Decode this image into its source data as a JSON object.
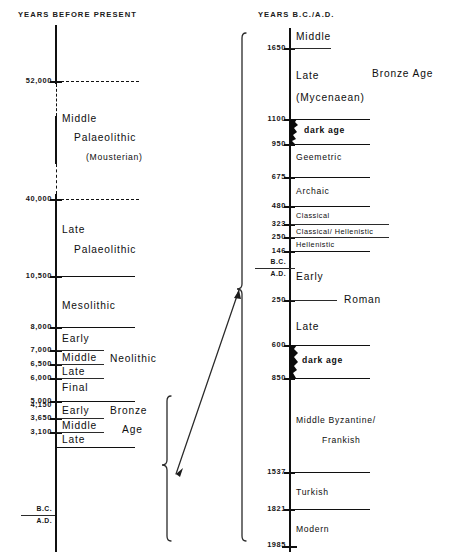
{
  "figure": {
    "type": "timeline-diagram",
    "left_column_title": "YEARS BEFORE PRESENT",
    "right_column_title": "YEARS B.C./A.D."
  },
  "left_axis": {
    "title": "YEARS BEFORE PRESENT",
    "unit": "years before present",
    "ticks": [
      {
        "label": "52,000",
        "kind": "dashed"
      },
      {
        "label": "40,000",
        "kind": "dashed"
      },
      {
        "label": "10,500",
        "kind": "solid"
      },
      {
        "label": "8,000",
        "kind": "solid"
      },
      {
        "label": "7,000",
        "kind": "solid"
      },
      {
        "label": "6,500",
        "kind": "solid"
      },
      {
        "label": "6,000",
        "kind": "solid"
      },
      {
        "label": "5,000",
        "kind": "solid"
      },
      {
        "label": "4,150",
        "kind": "solid"
      },
      {
        "label": "3,650",
        "kind": "solid"
      },
      {
        "label": "3,100",
        "kind": "solid"
      },
      {
        "label": "B.C.",
        "kind": "era"
      },
      {
        "label": "A.D.",
        "kind": "era"
      }
    ],
    "periods": [
      {
        "name": "Middle",
        "second_line": "Palaeolithic",
        "note": "(Mousterian)"
      },
      {
        "name": "Late",
        "second_line": "Palaeolithic"
      },
      {
        "name": "Mesolithic"
      },
      {
        "name": "Early"
      },
      {
        "name": "Middle"
      },
      {
        "name": "Late"
      },
      {
        "name": "Final"
      },
      {
        "name": "Early"
      },
      {
        "name": "Middle"
      },
      {
        "name": "Late"
      }
    ],
    "group_labels": [
      {
        "name": "Neolithic"
      },
      {
        "name": "Bronze",
        "second_line": "Age"
      }
    ]
  },
  "right_axis": {
    "title": "YEARS B.C./A.D.",
    "ticks": [
      {
        "label": "1650"
      },
      {
        "label": "1100"
      },
      {
        "label": "950"
      },
      {
        "label": "675"
      },
      {
        "label": "480"
      },
      {
        "label": "323"
      },
      {
        "label": "250"
      },
      {
        "label": "146"
      },
      {
        "label": "B.C."
      },
      {
        "label": "A.D."
      },
      {
        "label": "250"
      },
      {
        "label": "600"
      },
      {
        "label": "850"
      },
      {
        "label": "1537"
      },
      {
        "label": "1821"
      },
      {
        "label": "1985"
      }
    ],
    "periods": [
      {
        "name": "Middle"
      },
      {
        "name": "Late",
        "second_line": "(Mycenaean)"
      },
      {
        "name": "dark age"
      },
      {
        "name": "Geemetric"
      },
      {
        "name": "Archaic"
      },
      {
        "name": "Classical"
      },
      {
        "name": "Classical/ Hellenistic"
      },
      {
        "name": "Hellenistic"
      },
      {
        "name": "Early"
      },
      {
        "name": "Late"
      },
      {
        "name": "dark age"
      },
      {
        "name": "Middle Byzantine/",
        "second_line": "Frankish"
      },
      {
        "name": "Turkish"
      },
      {
        "name": "Modern"
      }
    ],
    "group_labels": [
      {
        "name": "Bronze Age"
      },
      {
        "name": "Roman"
      }
    ]
  }
}
